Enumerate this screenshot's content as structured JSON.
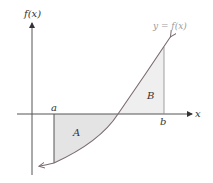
{
  "diagram": {
    "axes": {
      "y_label": "f(x)",
      "x_label": "x"
    },
    "curve_label": "y = f(x)",
    "bounds": {
      "left": "a",
      "right": "b"
    },
    "regions": [
      {
        "label": "A",
        "position": "below x-axis",
        "fill": "#e6e6e6"
      },
      {
        "label": "B",
        "position": "above x-axis",
        "fill": "#efefef"
      }
    ],
    "colors": {
      "axis": "#555555",
      "curve": "#7a6a72",
      "shade": "#e6e6e6",
      "bound_line": "#555555"
    }
  }
}
